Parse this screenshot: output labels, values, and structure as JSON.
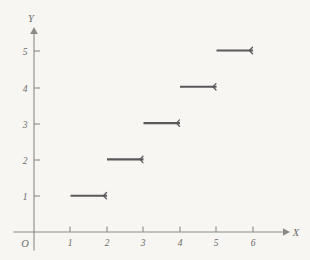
{
  "figure": {
    "background_color": "#f7f6f3",
    "axis_color": "#8a8a86",
    "curve_color": "#59595a",
    "label_color": "#6b6b68",
    "origin_label": "O",
    "x_axis_name": "X",
    "y_axis_name": "Y"
  },
  "chart_data": {
    "type": "line",
    "title": "",
    "subtitle": "",
    "xlabel": "X",
    "ylabel": "Y",
    "plot_style": "step-function / floor function, right-open intervals",
    "xlim": [
      0,
      6.9
    ],
    "ylim": [
      0,
      5.6
    ],
    "grid": false,
    "legend": null,
    "xticks": [
      1,
      2,
      3,
      4,
      5,
      6
    ],
    "xtick_labels": [
      "1",
      "2",
      "3",
      "4",
      "5",
      "6"
    ],
    "yticks": [
      1,
      2,
      3,
      4,
      5
    ],
    "ytick_labels": [
      "1",
      "2",
      "3",
      "4",
      "5"
    ],
    "origin_label": "O",
    "series": [
      {
        "name": "step",
        "marker_left": "closed",
        "marker_right": "open",
        "segments": [
          {
            "x_start": 1,
            "x_end": 2,
            "y": 1
          },
          {
            "x_start": 2,
            "x_end": 3,
            "y": 2
          },
          {
            "x_start": 3,
            "x_end": 4,
            "y": 3
          },
          {
            "x_start": 4,
            "x_end": 5,
            "y": 4
          },
          {
            "x_start": 5,
            "x_end": 6,
            "y": 5
          }
        ]
      }
    ]
  }
}
